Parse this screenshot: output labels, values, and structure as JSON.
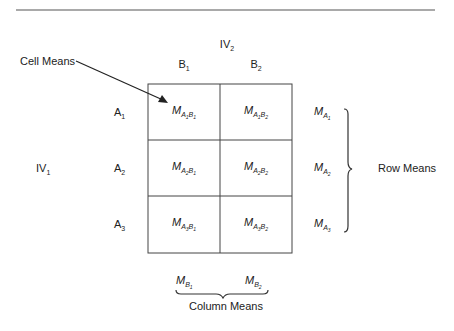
{
  "title": {
    "iv2": "IV",
    "iv2_sub": "2",
    "iv1": "IV",
    "iv1_sub": "1"
  },
  "columns": [
    {
      "label": "B",
      "sub": "1"
    },
    {
      "label": "B",
      "sub": "2"
    }
  ],
  "rows": [
    {
      "label": "A",
      "sub": "1"
    },
    {
      "label": "A",
      "sub": "2"
    },
    {
      "label": "A",
      "sub": "3"
    }
  ],
  "cells": [
    [
      {
        "m": "M",
        "a": "A",
        "ai": "1",
        "b": "B",
        "bi": "1"
      },
      {
        "m": "M",
        "a": "A",
        "ai": "1",
        "b": "B",
        "bi": "2"
      }
    ],
    [
      {
        "m": "M",
        "a": "A",
        "ai": "2",
        "b": "B",
        "bi": "1"
      },
      {
        "m": "M",
        "a": "A",
        "ai": "2",
        "b": "B",
        "bi": "2"
      }
    ],
    [
      {
        "m": "M",
        "a": "A",
        "ai": "3",
        "b": "B",
        "bi": "1"
      },
      {
        "m": "M",
        "a": "A",
        "ai": "3",
        "b": "B",
        "bi": "2"
      }
    ]
  ],
  "row_means": [
    {
      "m": "M",
      "a": "A",
      "ai": "1"
    },
    {
      "m": "M",
      "a": "A",
      "ai": "2"
    },
    {
      "m": "M",
      "a": "A",
      "ai": "3"
    }
  ],
  "col_means": [
    {
      "m": "M",
      "b": "B",
      "bi": "1"
    },
    {
      "m": "M",
      "b": "B",
      "bi": "2"
    }
  ],
  "annotations": {
    "cell_means": "Cell Means",
    "row_means": "Row Means",
    "column_means": "Column Means"
  },
  "colors": {
    "line": "#333333",
    "text": "#222222"
  }
}
